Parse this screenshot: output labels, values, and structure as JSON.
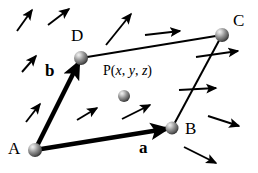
{
  "figure": {
    "background_color": "#ffffff",
    "stroke_color": "#000000",
    "sphere_color": "#8c8c8c",
    "sphere_highlight_color": "#e8e8e8",
    "width": 258,
    "height": 173
  },
  "points": [
    {
      "id": "A",
      "label": "A",
      "x": 35,
      "y": 150,
      "label_x": 8,
      "label_y": 140,
      "radius": 7
    },
    {
      "id": "B",
      "label": "B",
      "x": 172,
      "y": 128,
      "label_x": 185,
      "label_y": 120,
      "radius": 6.5
    },
    {
      "id": "C",
      "label": "C",
      "x": 222,
      "y": 35,
      "label_x": 233,
      "label_y": 12,
      "radius": 7
    },
    {
      "id": "D",
      "label": "D",
      "x": 81,
      "y": 58,
      "label_x": 71,
      "label_y": 27,
      "radius": 7
    },
    {
      "id": "P",
      "label": "",
      "x": 124,
      "y": 96,
      "label_x": 0,
      "label_y": 0,
      "radius": 6
    }
  ],
  "point_p_label": {
    "prefix": "P(",
    "x_var": "x",
    "sep1": ", ",
    "y_var": "y",
    "sep2": ", ",
    "z_var": "z",
    "suffix": ")",
    "full_text": "P(x, y, z)",
    "label_x": 103,
    "label_y": 64
  },
  "vectors": [
    {
      "id": "a",
      "label": "a",
      "from": "A",
      "to": "B",
      "x1": 35,
      "y1": 150,
      "x2": 172,
      "y2": 128,
      "bold": true,
      "stroke_width": 4.5,
      "label_x": 139,
      "label_y": 139
    },
    {
      "id": "b",
      "label": "b",
      "from": "A",
      "to": "D",
      "x1": 35,
      "y1": 150,
      "x2": 81,
      "y2": 58,
      "bold": true,
      "stroke_width": 4.5,
      "label_x": 45,
      "label_y": 62
    }
  ],
  "edges": [
    {
      "id": "DC",
      "from": "D",
      "to": "C",
      "x1": 81,
      "y1": 58,
      "x2": 222,
      "y2": 35,
      "stroke_width": 2
    },
    {
      "id": "BC",
      "from": "B",
      "to": "C",
      "x1": 172,
      "y1": 128,
      "x2": 222,
      "y2": 35,
      "stroke_width": 2
    }
  ],
  "field_arrows": [
    {
      "id": "arrow-1",
      "x1": 17,
      "y1": 31,
      "x2": 32,
      "y2": 10
    },
    {
      "id": "arrow-2",
      "x1": 48,
      "y1": 25,
      "x2": 69,
      "y2": 9
    },
    {
      "id": "arrow-3",
      "x1": 22,
      "y1": 72,
      "x2": 36,
      "y2": 56
    },
    {
      "id": "arrow-4",
      "x1": 26,
      "y1": 122,
      "x2": 40,
      "y2": 104
    },
    {
      "id": "arrow-5",
      "x1": 106,
      "y1": 45,
      "x2": 131,
      "y2": 14
    },
    {
      "id": "arrow-6",
      "x1": 145,
      "y1": 35,
      "x2": 180,
      "y2": 31
    },
    {
      "id": "arrow-7",
      "x1": 77,
      "y1": 120,
      "x2": 97,
      "y2": 108
    },
    {
      "id": "arrow-8",
      "x1": 122,
      "y1": 119,
      "x2": 150,
      "y2": 105
    },
    {
      "id": "arrow-9",
      "x1": 196,
      "y1": 57,
      "x2": 238,
      "y2": 51
    },
    {
      "id": "arrow-10",
      "x1": 179,
      "y1": 90,
      "x2": 216,
      "y2": 88
    },
    {
      "id": "arrow-11",
      "x1": 208,
      "y1": 116,
      "x2": 239,
      "y2": 126
    },
    {
      "id": "arrow-12",
      "x1": 184,
      "y1": 147,
      "x2": 216,
      "y2": 163
    }
  ]
}
